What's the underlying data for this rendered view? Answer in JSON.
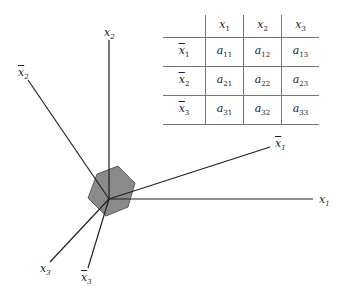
{
  "diagram": {
    "axes": [
      {
        "id": "x1",
        "label": "x",
        "sub": "1",
        "bar": false
      },
      {
        "id": "x2",
        "label": "x",
        "sub": "2",
        "bar": false
      },
      {
        "id": "x3",
        "label": "x",
        "sub": "3",
        "bar": false
      },
      {
        "id": "xbar1",
        "label": "x",
        "sub": "1",
        "bar": true
      },
      {
        "id": "xbar2",
        "label": "x",
        "sub": "2",
        "bar": true
      },
      {
        "id": "xbar3",
        "label": "x",
        "sub": "3",
        "bar": true
      }
    ],
    "colors": {
      "hexagon_fill": "#8a8a8a",
      "line": "#222222",
      "grid": "#777777"
    }
  },
  "table": {
    "col_headers": [
      {
        "v": "x",
        "s": "1"
      },
      {
        "v": "x",
        "s": "2"
      },
      {
        "v": "x",
        "s": "3"
      }
    ],
    "row_headers": [
      {
        "v": "x",
        "s": "1"
      },
      {
        "v": "x",
        "s": "2"
      },
      {
        "v": "x",
        "s": "3"
      }
    ],
    "cells": [
      [
        {
          "v": "a",
          "s": "11"
        },
        {
          "v": "a",
          "s": "12"
        },
        {
          "v": "a",
          "s": "13"
        }
      ],
      [
        {
          "v": "a",
          "s": "21"
        },
        {
          "v": "a",
          "s": "22"
        },
        {
          "v": "a",
          "s": "23"
        }
      ],
      [
        {
          "v": "a",
          "s": "31"
        },
        {
          "v": "a",
          "s": "32"
        },
        {
          "v": "a",
          "s": "33"
        }
      ]
    ]
  }
}
